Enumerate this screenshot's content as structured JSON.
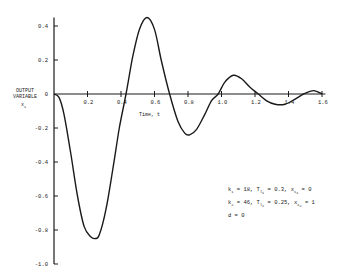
{
  "chart_data": {
    "type": "line",
    "title": "",
    "xlabel": "Time, t",
    "ylabel": "OUTPUT VARIABLE x1",
    "ylabel_lines": [
      "OUTPUT",
      "VARIABLE"
    ],
    "ylabel_symbol": "x",
    "ylabel_subscript": "1",
    "xlim": [
      0,
      1.6
    ],
    "ylim": [
      -1.0,
      0.45
    ],
    "x_ticks": [
      "0.2",
      "0.4",
      "0.6",
      "0.8",
      "1.0",
      "1.2",
      "1.4",
      "1.6"
    ],
    "y_ticks": [
      "0.4",
      "0.2",
      "0",
      "-0.2",
      "-0.4",
      "-0.6",
      "-0.8",
      "-1.0"
    ],
    "grid": false,
    "series": [
      {
        "name": "x1(t)",
        "x": [
          0,
          0.03,
          0.06,
          0.1,
          0.14,
          0.18,
          0.22,
          0.245,
          0.27,
          0.31,
          0.35,
          0.39,
          0.43,
          0.47,
          0.51,
          0.555,
          0.6,
          0.64,
          0.69,
          0.74,
          0.78,
          0.81,
          0.85,
          0.9,
          0.94,
          0.98,
          1.02,
          1.07,
          1.12,
          1.17,
          1.22,
          1.27,
          1.32,
          1.38,
          1.44,
          1.49,
          1.55,
          1.6
        ],
        "y": [
          0,
          -0.02,
          -0.12,
          -0.35,
          -0.6,
          -0.78,
          -0.84,
          -0.85,
          -0.83,
          -0.68,
          -0.45,
          -0.2,
          0.0,
          0.22,
          0.38,
          0.45,
          0.38,
          0.2,
          0.0,
          -0.16,
          -0.23,
          -0.24,
          -0.21,
          -0.12,
          -0.04,
          0.0,
          0.07,
          0.11,
          0.09,
          0.04,
          0.0,
          -0.04,
          -0.06,
          -0.06,
          -0.03,
          0.0,
          0.02,
          0.0
        ]
      }
    ],
    "annotations": [
      {
        "line": 1,
        "parts": [
          [
            "k",
            "1"
          ],
          [
            " = 18,  ",
            ""
          ],
          [
            "T",
            "l",
            "1"
          ],
          [
            " = 0.3,  ",
            ""
          ],
          [
            "x",
            "s",
            "1"
          ],
          [
            " = 0",
            ""
          ]
        ],
        "text": "k1 = 18,  Tl1 = 0.3,  xs1 = 0"
      },
      {
        "line": 2,
        "text": "k2 = 46,  Tl2 = 0.25,  xs2 = 1"
      },
      {
        "line": 3,
        "text": "d = 0"
      }
    ]
  },
  "annotations_display": {
    "k1": "k",
    "k1_sub": "1",
    "k1_val": " = 18,  ",
    "T1": "T",
    "T1_sub": "l",
    "T1_subsub": "1",
    "T1_val": " = 0.3,  ",
    "xs1": "x",
    "xs1_sub": "s",
    "xs1_subsub": "1",
    "xs1_val": " = 0",
    "k2": "k",
    "k2_sub": "2",
    "k2_val": " = 46,  ",
    "T2": "T",
    "T2_sub": "l",
    "T2_subsub": "2",
    "T2_val": " = 0.25,  ",
    "xs2": "x",
    "xs2_sub": "s",
    "xs2_subsub": "2",
    "xs2_val": " = 1",
    "d_line": "d = 0"
  },
  "colors": {
    "line": "#1a1a1a",
    "axis": "#1a1a1a",
    "text": "#222222"
  }
}
